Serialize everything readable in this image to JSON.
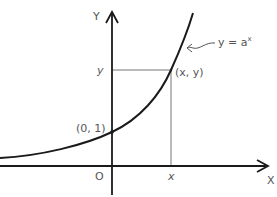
{
  "diagram": {
    "axes": {
      "x_label": "X",
      "y_label": "Y",
      "origin_label": "O"
    },
    "curve": {
      "equation_label": "y = a",
      "equation_exponent": "x",
      "color": "#1a1a1a"
    },
    "points": [
      {
        "label": "(0, 1)",
        "role": "y-intercept"
      },
      {
        "label": "(x, y)",
        "role": "general point"
      }
    ],
    "guides": {
      "x_tick_label": "x",
      "y_tick_label": "y"
    },
    "colors": {
      "axis": "#1a1a1a",
      "guide": "#666666",
      "text": "#555555"
    }
  }
}
